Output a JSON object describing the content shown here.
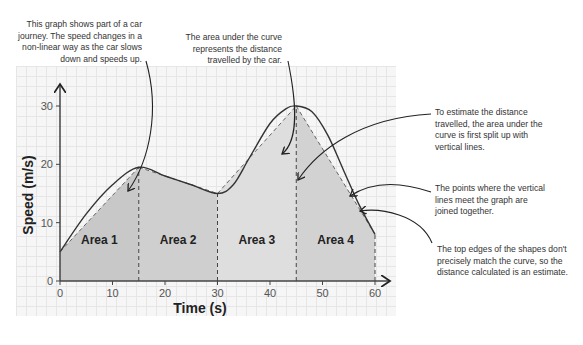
{
  "annotations": {
    "top_left": "This graph shows part of a car journey. The speed changes in a non-linear way as the car slows down and speeds up.",
    "top_middle": "The area under the curve represents the distance travelled by the car.",
    "right_1": "To estimate the distance travelled, the area under the curve is first split up with vertical lines.",
    "right_2": "The points where the vertical lines meet the graph are joined together.",
    "right_3": "The top edges of the shapes don't precisely match the curve, so the distance calculated is an estimate."
  },
  "chart_data": {
    "type": "area",
    "title": "",
    "xlabel": "Time (s)",
    "ylabel": "Speed (m/s)",
    "xlim": [
      0,
      60
    ],
    "ylim": [
      0,
      30
    ],
    "xticks": [
      0,
      10,
      20,
      30,
      40,
      50,
      60
    ],
    "yticks": [
      0,
      10,
      20,
      30
    ],
    "grid": true,
    "curve": {
      "name": "Speed curve",
      "x": [
        0,
        5,
        10,
        15,
        20,
        25,
        30,
        33,
        36,
        40,
        43,
        45,
        48,
        51,
        54,
        57,
        60
      ],
      "y": [
        5,
        11.5,
        16.5,
        19.5,
        18,
        16.5,
        15,
        16.5,
        21,
        27,
        29.5,
        30,
        29,
        25,
        19,
        13,
        8
      ]
    },
    "trapezoids": [
      {
        "label": "Area 1",
        "x0": 0,
        "x1": 15,
        "y0": 5,
        "y1": 19.5,
        "shade": "#c8c8c8"
      },
      {
        "label": "Area 2",
        "x0": 15,
        "x1": 30,
        "y0": 19.5,
        "y1": 15,
        "shade": "#cfcfcf"
      },
      {
        "label": "Area 3",
        "x0": 30,
        "x1": 45,
        "y0": 15,
        "y1": 30,
        "shade": "#dedede"
      },
      {
        "label": "Area 4",
        "x0": 45,
        "x1": 60,
        "y0": 30,
        "y1": 8,
        "shade": "#d2d2d2"
      }
    ]
  }
}
